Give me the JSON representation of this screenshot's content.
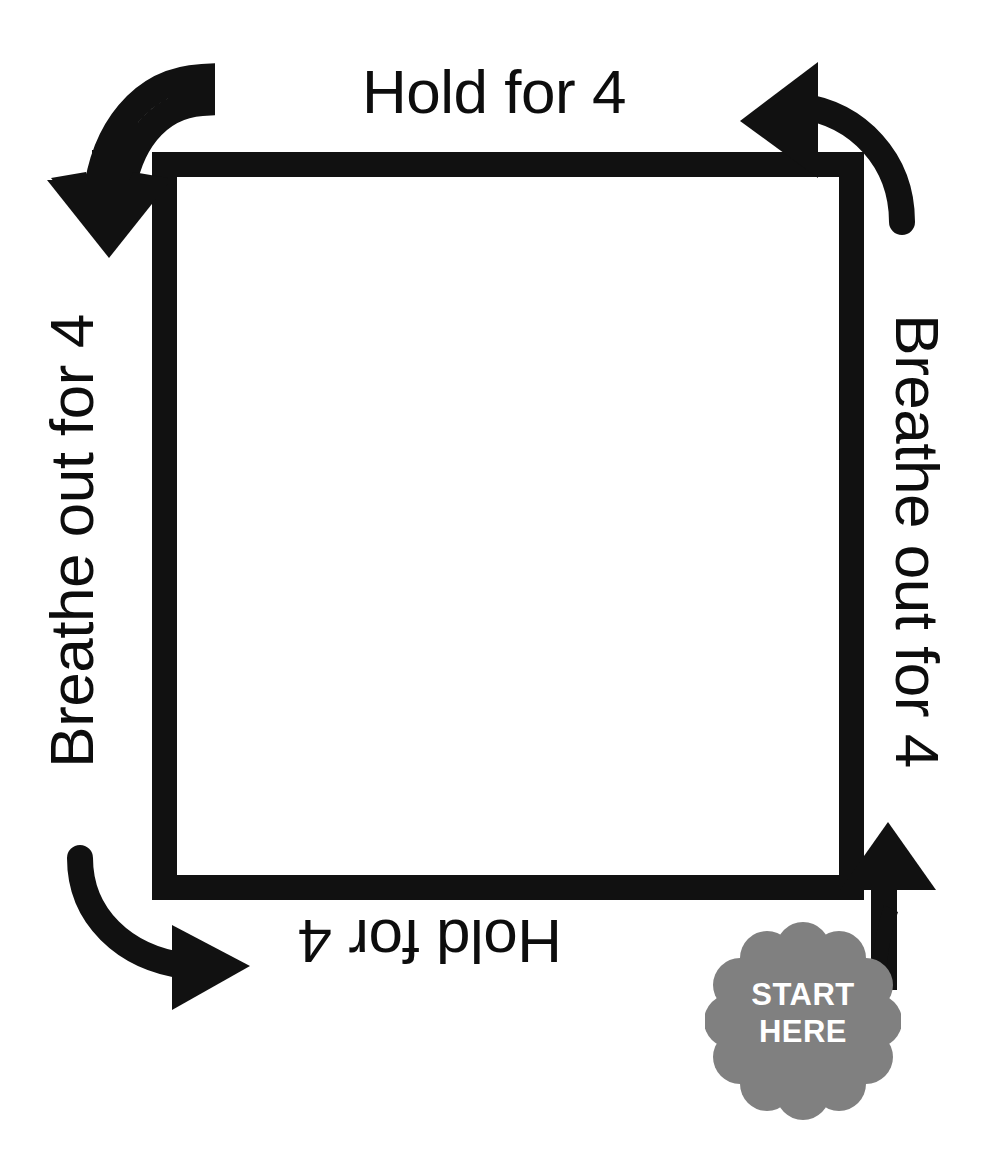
{
  "page": {
    "background_color": "#ffffff",
    "width": 988,
    "height": 1173
  },
  "diagram": {
    "type": "box-breathing-cycle",
    "stroke_color": "#111111",
    "square": {
      "x": 152,
      "y": 152,
      "size": 700,
      "border_width": 25,
      "fill": "#ffffff"
    },
    "labels": {
      "top": "Hold for 4",
      "right": "Breathe out for 4",
      "bottom": "Hold for 4",
      "left": "Breathe out for 4"
    },
    "arrows": [
      {
        "name": "arrow-top-left",
        "direction": "down",
        "curve": "clockwise"
      },
      {
        "name": "arrow-top-right",
        "direction": "left",
        "curve": "clockwise"
      },
      {
        "name": "arrow-bottom-left",
        "direction": "right",
        "curve": "clockwise"
      },
      {
        "name": "arrow-bottom-right",
        "direction": "up",
        "curve": "straight"
      }
    ]
  },
  "start_badge": {
    "line1": "START",
    "line2": "HERE",
    "fill_color": "#808080",
    "text_color": "#ffffff",
    "shape": "scalloped-flower"
  }
}
